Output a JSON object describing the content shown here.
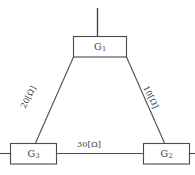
{
  "diagram": {
    "background_color": "#ffffff",
    "line_color": "#4d4d4d",
    "box_fill": "#ffffff",
    "text_color": "#3a3a3a",
    "nodes": [
      {
        "id": "g1",
        "label_main": "G",
        "label_sub": "1",
        "label_full": "G1",
        "x": 73,
        "y": 36,
        "width": 54,
        "height": 21
      },
      {
        "id": "g3",
        "label_main": "G",
        "label_sub": "3",
        "label_full": "G3",
        "x": 10,
        "y": 143,
        "width": 47,
        "height": 21
      },
      {
        "id": "g2",
        "label_main": "G",
        "label_sub": "2",
        "label_full": "G2",
        "x": 143,
        "y": 143,
        "width": 47,
        "height": 21
      }
    ],
    "edges": [
      {
        "id": "edge-g1-g3",
        "from": "g1",
        "to": "g3",
        "label": "20[Ω]",
        "value": 20,
        "unit": "Ω",
        "orientation": "diagonal-left"
      },
      {
        "id": "edge-g1-g2",
        "from": "g1",
        "to": "g2",
        "label": "10[Ω]",
        "value": 10,
        "unit": "Ω",
        "orientation": "diagonal-right"
      },
      {
        "id": "edge-g3-g2",
        "from": "g3",
        "to": "g2",
        "label": "30[Ω]",
        "value": 30,
        "unit": "Ω",
        "orientation": "horizontal"
      }
    ],
    "feeder": {
      "id": "feeder-g1",
      "attached_to": "g1",
      "label": ""
    }
  }
}
